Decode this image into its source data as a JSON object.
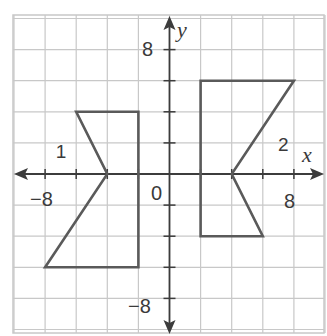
{
  "chart_data": {
    "type": "scatter",
    "title": "",
    "xlabel": "x",
    "ylabel": "y",
    "xlim": [
      -10,
      10
    ],
    "ylim": [
      -10,
      10
    ],
    "grid": true,
    "grid_step": 2,
    "ticks": {
      "x": [
        {
          "value": -8,
          "label": "−8"
        },
        {
          "value": 8,
          "label": "8"
        }
      ],
      "y": [
        {
          "value": 8,
          "label": "8"
        },
        {
          "value": -8,
          "label": "−8"
        }
      ],
      "origin_label": "0"
    },
    "series": [
      {
        "name": "1",
        "shape": "polygon",
        "vertices": [
          [
            -6,
            4
          ],
          [
            -2,
            4
          ],
          [
            -2,
            -6
          ],
          [
            -8,
            -6
          ],
          [
            -4,
            0
          ]
        ],
        "label_position": [
          -7,
          1.5
        ]
      },
      {
        "name": "2",
        "shape": "polygon",
        "vertices": [
          [
            2,
            6
          ],
          [
            8,
            6
          ],
          [
            4,
            0
          ],
          [
            6,
            -4
          ],
          [
            2,
            -4
          ]
        ],
        "label_position": [
          7.3,
          1.9
        ]
      }
    ]
  },
  "colors": {
    "grid": "#c8c8c8",
    "axis": "#3c3c3c",
    "figure": "#5a5a5a",
    "text": "#3a3a3a"
  }
}
